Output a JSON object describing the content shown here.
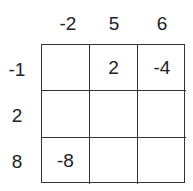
{
  "column_headers": [
    "-2",
    "5",
    "6"
  ],
  "row_headers": [
    "-1",
    "2",
    "8"
  ],
  "cells": [
    [
      "",
      "2",
      "-4"
    ],
    [
      "",
      "",
      ""
    ],
    [
      "-8",
      "",
      ""
    ]
  ]
}
